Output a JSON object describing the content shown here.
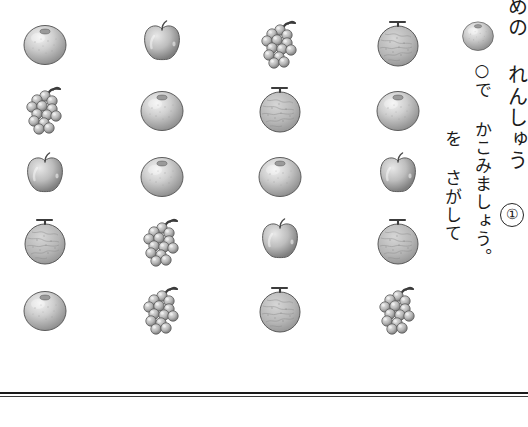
{
  "page": {
    "background_color": "#ffffff",
    "ink_color": "#1b1b1b"
  },
  "instruction": {
    "problem_number": "①",
    "column_title": "めの れんしゅう",
    "column_middle": "○で かこみましょう。",
    "column_left": "を さがして",
    "full_text_reading": "① めの れんしゅう / ○を さがして ○で かこみましょう。",
    "sample_fruit": "orange"
  },
  "grid": {
    "rows": 5,
    "columns": 4,
    "cells": [
      [
        {
          "fruit": "orange",
          "label": "みかん"
        },
        {
          "fruit": "apple",
          "label": "りんご"
        },
        {
          "fruit": "grapes",
          "label": "ぶどう"
        },
        {
          "fruit": "melon",
          "label": "メロン"
        }
      ],
      [
        {
          "fruit": "grapes",
          "label": "ぶどう"
        },
        {
          "fruit": "orange",
          "label": "みかん"
        },
        {
          "fruit": "melon",
          "label": "メロン"
        },
        {
          "fruit": "orange",
          "label": "みかん"
        }
      ],
      [
        {
          "fruit": "apple",
          "label": "りんご"
        },
        {
          "fruit": "orange",
          "label": "みかん"
        },
        {
          "fruit": "orange",
          "label": "みかん"
        },
        {
          "fruit": "apple",
          "label": "りんご"
        }
      ],
      [
        {
          "fruit": "melon",
          "label": "メロン"
        },
        {
          "fruit": "grapes",
          "label": "ぶどう"
        },
        {
          "fruit": "apple",
          "label": "りんご"
        },
        {
          "fruit": "melon",
          "label": "メロン"
        }
      ],
      [
        {
          "fruit": "orange",
          "label": "みかん"
        },
        {
          "fruit": "grapes",
          "label": "ぶどう"
        },
        {
          "fruit": "melon",
          "label": "メロン"
        },
        {
          "fruit": "grapes",
          "label": "ぶどう"
        }
      ]
    ],
    "column_x": [
      15,
      132,
      250,
      368
    ],
    "row_y": [
      12,
      78,
      144,
      210,
      278
    ]
  },
  "footer": {
    "divider_color": "#1a1a1a"
  }
}
